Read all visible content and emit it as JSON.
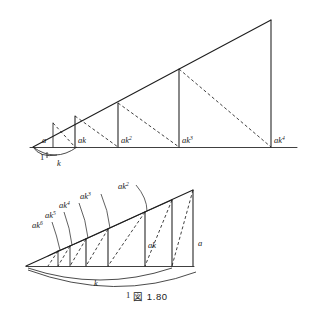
{
  "figure": {
    "caption": "図 1.80",
    "caption_prefix": "図",
    "caption_number": "1.80",
    "colors": {
      "ink": "#1d1d1d",
      "background": "#ffffff"
    }
  },
  "upper_diagram": {
    "name": "increasing-geometric-staircase",
    "baseline_label_left": "1",
    "baseline_label_right": "k",
    "bars": [
      {
        "label_base": "a",
        "label_exp": "",
        "x": 53,
        "top_y": 123,
        "bottom_y": 147
      },
      {
        "label_base": "ak",
        "label_exp": "",
        "x": 75,
        "top_y": 117,
        "bottom_y": 147
      },
      {
        "label_base": "ak",
        "label_exp": "2",
        "x": 118,
        "top_y": 103,
        "bottom_y": 147
      },
      {
        "label_base": "ak",
        "label_exp": "3",
        "x": 179,
        "top_y": 69,
        "bottom_y": 147
      },
      {
        "label_base": "ak",
        "label_exp": "4",
        "x": 271,
        "top_y": 20,
        "bottom_y": 147
      }
    ],
    "apex": {
      "x": 33,
      "y": 147
    },
    "baseline": {
      "x1": 30,
      "x2": 297,
      "y": 147
    }
  },
  "lower_diagram": {
    "name": "decreasing-geometric-staircase",
    "bracket_label_inner": "k",
    "bracket_label_outer": "1",
    "bars": [
      {
        "label_base": "ak",
        "label_exp": "6",
        "x": 58,
        "top_y": 250,
        "bottom_y": 266
      },
      {
        "label_base": "ak",
        "label_exp": "5",
        "x": 70,
        "top_y": 245,
        "bottom_y": 266
      },
      {
        "label_base": "ak",
        "label_exp": "4",
        "x": 86,
        "top_y": 238,
        "bottom_y": 266
      },
      {
        "label_base": "ak",
        "label_exp": "3",
        "x": 108,
        "top_y": 228,
        "bottom_y": 266
      },
      {
        "label_base": "ak",
        "label_exp": "2",
        "x": 145,
        "top_y": 212,
        "bottom_y": 266
      },
      {
        "label_base": "ak",
        "label_exp": "",
        "x": 193,
        "top_y": 190,
        "bottom_y": 266
      }
    ],
    "right_edge_label": "a",
    "apex": {
      "x": 26,
      "y": 266
    },
    "baseline": {
      "x1": 26,
      "x2": 193,
      "y": 266
    }
  }
}
